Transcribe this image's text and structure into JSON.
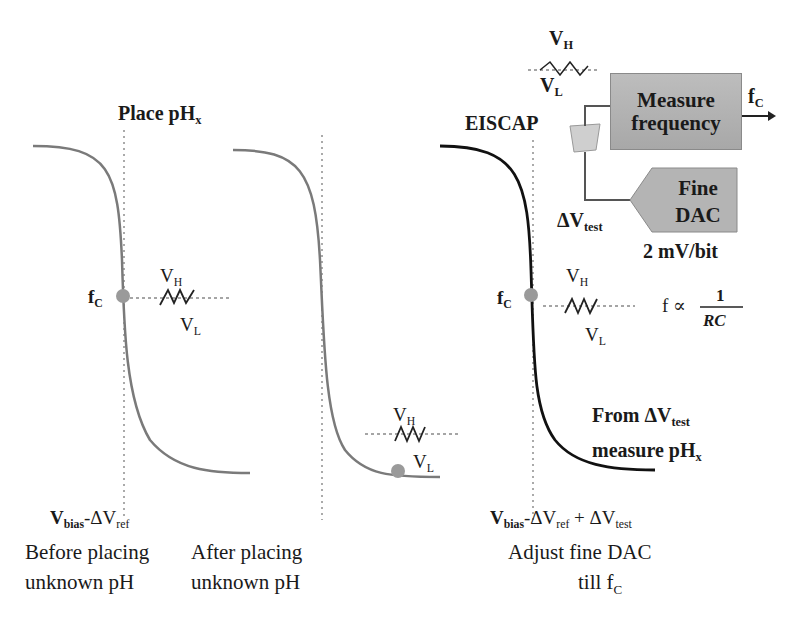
{
  "title": "Place pH",
  "title_sub": "x",
  "panels": [
    {
      "label_line1": "Before placing",
      "label_line2": "unknown pH",
      "voltage_main": "V",
      "voltage_sub1": "bias",
      "voltage_mid": "-ΔV",
      "voltage_sub2": "ref",
      "point_label": "f",
      "point_sub": "C",
      "vh": "V",
      "vh_sub": "H",
      "vl": "V",
      "vl_sub": "L"
    },
    {
      "label_line1": "After placing",
      "label_line2": "unknown pH",
      "vh": "V",
      "vh_sub": "H",
      "vl": "V",
      "vl_sub": "L"
    },
    {
      "label_line1": "Adjust fine DAC",
      "label_line2": "till f",
      "label_line2_sub": "C",
      "voltage_main": "V",
      "voltage_sub1": "bias",
      "voltage_mid": "-ΔV",
      "voltage_sub2": "ref",
      "voltage_plus": " + ΔV",
      "voltage_sub3": "test",
      "point_label": "f",
      "point_sub": "C",
      "vh": "V",
      "vh_sub": "H",
      "vl": "V",
      "vl_sub": "L"
    }
  ],
  "circuit": {
    "eiscap_label": "EISCAP",
    "top_vh": "V",
    "top_vh_sub": "H",
    "top_vl": "V",
    "top_vl_sub": "L",
    "measure_box_line1": "Measure",
    "measure_box_line2": "frequency",
    "output_label": "f",
    "output_sub": "C",
    "dac_box_line1": "Fine",
    "dac_box_line2": "DAC",
    "dac_resolution": "2 mV/bit",
    "dv_test": "ΔV",
    "dv_test_sub": "test",
    "formula_lhs": "f ∝",
    "formula_num": "1",
    "formula_den": "RC"
  },
  "conclusion": {
    "line1": "From ΔV",
    "line1_sub": "test",
    "line2": "measure pH",
    "line2_sub": "x"
  },
  "colors": {
    "curve_gray": "#7a7a7a",
    "curve_black": "#111111",
    "point": "#9a9a9a",
    "box_fill": "#b4b4b4"
  }
}
